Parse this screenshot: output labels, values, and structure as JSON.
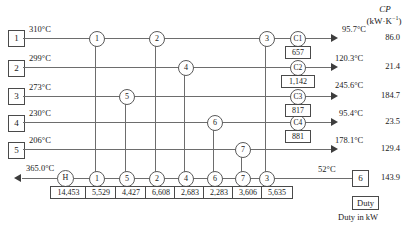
{
  "diagram": {
    "cp_header_line1": "CP",
    "cp_header_line2": "(kW·K",
    "cp_header_exp": "−1",
    "cp_header_line2_end": ")",
    "duty_legend_label": "Duty",
    "duty_legend_note": "Duty in kW"
  },
  "hot_streams": [
    {
      "id": "1",
      "inlet_temp": "310°C",
      "outlet_temp": "95.7°C",
      "cp": "86.0"
    },
    {
      "id": "2",
      "inlet_temp": "299°C",
      "outlet_temp": "120.3°C",
      "cp": "21.4"
    },
    {
      "id": "3",
      "inlet_temp": "273°C",
      "outlet_temp": "245.6°C",
      "cp": "184.7"
    },
    {
      "id": "4",
      "inlet_temp": "230°C",
      "outlet_temp": "95.4°C",
      "cp": "23.5"
    },
    {
      "id": "5",
      "inlet_temp": "206°C",
      "outlet_temp": "178.1°C",
      "cp": "129.4"
    }
  ],
  "cold_stream": {
    "id": "6",
    "inlet_temp": "52°C",
    "outlet_temp": "365.0°C",
    "cp": "143.9"
  },
  "coolers": [
    {
      "label": "C1",
      "duty": "657"
    },
    {
      "label": "C2",
      "duty": "1,142"
    },
    {
      "label": "C3",
      "duty": "817"
    },
    {
      "label": "C4",
      "duty": "881"
    }
  ],
  "hot_utility": {
    "label": "H",
    "duty": "14,453"
  },
  "matches_on_hot": [
    {
      "label": "1",
      "stream": "1"
    },
    {
      "label": "2",
      "stream": "1"
    },
    {
      "label": "3",
      "stream": "1"
    },
    {
      "label": "4",
      "stream": "2"
    },
    {
      "label": "5",
      "stream": "3"
    },
    {
      "label": "6",
      "stream": "4"
    },
    {
      "label": "7",
      "stream": "5"
    }
  ],
  "cold_line_units": [
    {
      "label": "H",
      "duty": "14,453"
    },
    {
      "label": "1",
      "duty": "5,529"
    },
    {
      "label": "5",
      "duty": "4,427"
    },
    {
      "label": "2",
      "duty": "6,608"
    },
    {
      "label": "4",
      "duty": "2,683"
    },
    {
      "label": "6",
      "duty": "2,283"
    },
    {
      "label": "7",
      "duty": "3,606"
    },
    {
      "label": "3",
      "duty": "5,635"
    }
  ]
}
